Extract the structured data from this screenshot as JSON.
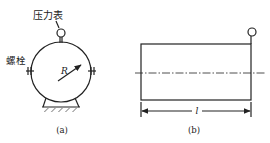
{
  "figure_a": {
    "caption": "(a)",
    "gauge_label": "压力表",
    "bolt_label": "螺栓",
    "radius_label": "R"
  },
  "figure_b": {
    "caption": "(b)",
    "length_label": "l"
  },
  "colors": {
    "line": "#222222",
    "background": "#ffffff"
  }
}
